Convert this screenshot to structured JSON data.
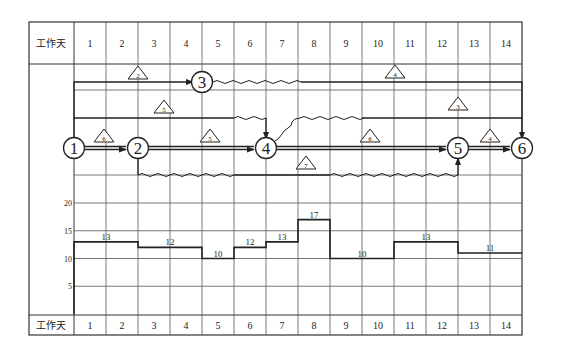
{
  "header": {
    "row_label": "工作天",
    "days": [
      "1",
      "2",
      "3",
      "4",
      "5",
      "6",
      "7",
      "8",
      "9",
      "10",
      "11",
      "12",
      "13",
      "14"
    ]
  },
  "footer": {
    "row_label": "工作天",
    "days": [
      "1",
      "2",
      "3",
      "4",
      "5",
      "6",
      "7",
      "8",
      "9",
      "10",
      "11",
      "12",
      "13",
      "14"
    ]
  },
  "network": {
    "nodes": [
      {
        "id": "1",
        "day_pos": 0,
        "row": "main"
      },
      {
        "id": "2",
        "day_pos": 2,
        "row": "main"
      },
      {
        "id": "3",
        "day_pos": 4,
        "row": "top"
      },
      {
        "id": "4",
        "day_pos": 6,
        "row": "main"
      },
      {
        "id": "5",
        "day_pos": 12,
        "row": "main"
      },
      {
        "id": "6",
        "day_pos": 14,
        "row": "main"
      }
    ],
    "activities": [
      {
        "from": "1",
        "to": "3",
        "resource": "2",
        "duration": 4,
        "free_float": 0
      },
      {
        "from": "1",
        "to": "4",
        "resource": "5",
        "duration": 5,
        "free_float": 1
      },
      {
        "from": "1",
        "to": "2",
        "resource": "6",
        "duration": 2,
        "free_float": 0
      },
      {
        "from": "2",
        "to": "4",
        "resource": "5",
        "duration": 4,
        "free_float": 0
      },
      {
        "from": "2",
        "to": "5",
        "resource": "7",
        "duration": 3,
        "free_float": 7
      },
      {
        "from": "3",
        "to": "6",
        "resource": "4",
        "duration": 7,
        "free_float": 3
      },
      {
        "from": "4",
        "to": "6",
        "resource": "3",
        "duration": 5,
        "free_float": 3
      },
      {
        "from": "4",
        "to": "5",
        "resource": "6",
        "duration": 6,
        "free_float": 0
      },
      {
        "from": "5",
        "to": "6",
        "resource": "4",
        "duration": 2,
        "free_float": 0
      }
    ]
  },
  "chart_data": {
    "type": "bar",
    "xlabel": "工作天",
    "ylabel": "",
    "categories": [
      "1",
      "2",
      "3",
      "4",
      "5",
      "6",
      "7",
      "8",
      "9",
      "10",
      "11",
      "12",
      "13",
      "14"
    ],
    "values": [
      13,
      13,
      12,
      12,
      10,
      12,
      13,
      17,
      10,
      10,
      13,
      13,
      11,
      11
    ],
    "segment_labels": [
      {
        "days": "1-2",
        "value": "13"
      },
      {
        "days": "3-4",
        "value": "12"
      },
      {
        "days": "5",
        "value": "10"
      },
      {
        "days": "6",
        "value": "12"
      },
      {
        "days": "7",
        "value": "13"
      },
      {
        "days": "8",
        "value": "17"
      },
      {
        "days": "9-10",
        "value": "10"
      },
      {
        "days": "11-12",
        "value": "13"
      },
      {
        "days": "13-14",
        "value": "11"
      }
    ],
    "yticks": [
      "5",
      "10",
      "15",
      "20"
    ],
    "ylim": [
      0,
      20
    ],
    "grid": true
  }
}
